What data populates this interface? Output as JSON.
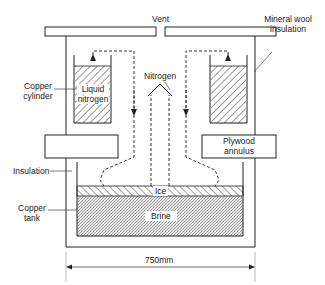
{
  "figure": {
    "title_partial": "",
    "labels": {
      "vent": "Vent",
      "mineral_wool": [
        "Mineral wool",
        "insulation"
      ],
      "copper_cylinder": [
        "Copper",
        "cylinder"
      ],
      "liquid_nitrogen": [
        "Liquid",
        "nitrogen"
      ],
      "nitrogen": "Nitrogen",
      "plywood_annulus": [
        "Plywood",
        "annulus"
      ],
      "insulation": "Insulation",
      "copper_tank": [
        "Copper",
        "tank"
      ],
      "ice": "Ice",
      "brine": "Brine",
      "dimension": "750mm"
    },
    "colors": {
      "line": "#222222",
      "brine_fill": "#d9d9d9",
      "background": "#ffffff"
    }
  }
}
